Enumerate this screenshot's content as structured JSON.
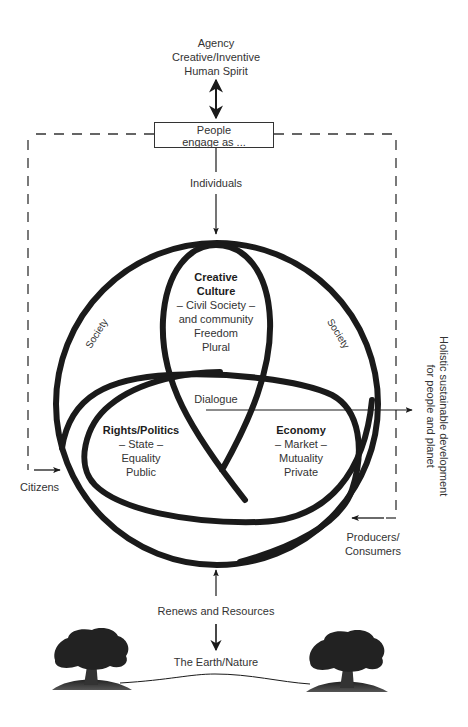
{
  "top": {
    "agency_lines": [
      "Agency",
      "Creative/Inventive",
      "Human Spirit"
    ]
  },
  "engage_box": {
    "lines": [
      "People",
      "engage as ..."
    ]
  },
  "individuals_label": "Individuals",
  "sectors": {
    "culture": {
      "title_lines": [
        "Creative",
        "Culture"
      ],
      "lines": [
        "– Civil Society –",
        "and community",
        "Freedom",
        "Plural"
      ]
    },
    "rights": {
      "title": "Rights/Politics",
      "lines": [
        "– State –",
        "Equality",
        "Public"
      ]
    },
    "economy": {
      "title": "Economy",
      "lines": [
        "– Market –",
        "Mutuality",
        "Private"
      ]
    }
  },
  "center_label": "Dialogue",
  "society_labels": [
    "Society",
    "Society"
  ],
  "citizens_label": "Citizens",
  "producers_label": [
    "Producers/",
    "Consumers"
  ],
  "outcome_label": [
    "Holistic sustainable development",
    "for people and planet"
  ],
  "renews_label": "Renews and Resources",
  "earth_label": "The Earth/Nature",
  "colors": {
    "stroke": "#1a1a1a",
    "text": "#333333",
    "background": "#ffffff"
  }
}
